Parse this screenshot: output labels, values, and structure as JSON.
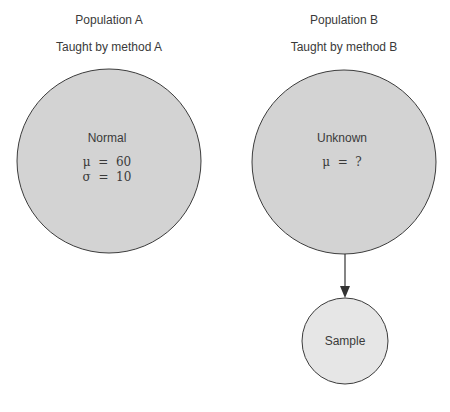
{
  "population_a": {
    "title": "Population A",
    "subtitle": "Taught by method A",
    "distribution": "Normal",
    "mu_line": "μ  =  60",
    "sigma_line": "σ  =  10"
  },
  "population_b": {
    "title": "Population B",
    "subtitle": "Taught by method B",
    "distribution": "Unknown",
    "mu_line": "μ  =  ?"
  },
  "sample": {
    "label": "Sample"
  },
  "colors": {
    "population_fill": "#d3d3d3",
    "sample_fill": "#e6e6e6",
    "stroke": "#3c3c3c"
  }
}
